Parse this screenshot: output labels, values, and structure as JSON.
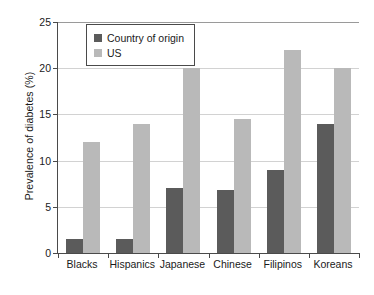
{
  "chart_data": {
    "type": "bar",
    "title": "",
    "xlabel": "",
    "ylabel": "Prevalence of diabetes (%)",
    "ylim": [
      0,
      25
    ],
    "yticks": [
      0,
      5,
      10,
      15,
      20,
      25
    ],
    "grid": true,
    "legend_position": "top-left",
    "categories": [
      "Blacks",
      "Hispanics",
      "Japanese",
      "Chinese",
      "Filipinos",
      "Koreans"
    ],
    "series": [
      {
        "name": "Country of origin",
        "color": "#5b5b5b",
        "values": [
          1.5,
          1.5,
          7.0,
          6.8,
          9.0,
          14.0
        ]
      },
      {
        "name": "US",
        "color": "#b9b9b9",
        "values": [
          12.0,
          14.0,
          20.0,
          14.5,
          22.0,
          20.0
        ]
      }
    ]
  }
}
